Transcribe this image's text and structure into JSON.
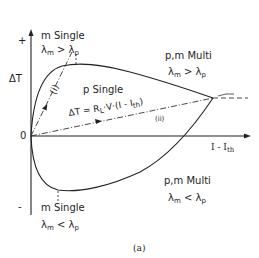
{
  "figure": {
    "caption": "(a)",
    "axes": {
      "y_label": "ΔT",
      "y_plus": "+",
      "y_minus": "-",
      "origin": "0",
      "x_label": "I - I",
      "x_label_sub": "th"
    },
    "regions": {
      "top_left": {
        "title": "m Single",
        "cond_lhs": "λ",
        "cond_lhs_sub": "m",
        "cond_op": ">",
        "cond_rhs": "λ",
        "cond_rhs_sub": "p"
      },
      "top_right": {
        "title": "p,m Multi",
        "cond_lhs": "λ",
        "cond_lhs_sub": "m",
        "cond_op": ">",
        "cond_rhs": "λ",
        "cond_rhs_sub": "p"
      },
      "center": {
        "title": "p Single"
      },
      "bottom_left": {
        "title": "m Single",
        "cond_lhs": "λ",
        "cond_lhs_sub": "m",
        "cond_op": "<",
        "cond_rhs": "λ",
        "cond_rhs_sub": "p"
      },
      "bottom_right": {
        "title": "p,m Multi",
        "cond_lhs": "λ",
        "cond_lhs_sub": "m",
        "cond_op": "<",
        "cond_rhs": "λ",
        "cond_rhs_sub": "p"
      }
    },
    "equation": {
      "lhs": "ΔT = R",
      "r_sub": "L",
      "rhs": "·V·(I - I",
      "i_sub": "th",
      "close": ")"
    },
    "path_labels": {
      "path_i": "(i)",
      "path_ii": "(ii)"
    }
  }
}
